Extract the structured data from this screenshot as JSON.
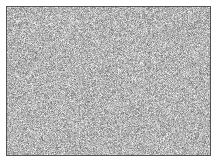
{
  "figure": {
    "kind": "noise-texture-image",
    "caption": "",
    "canvas": {
      "width": 220,
      "height": 165,
      "background_color": "#ffffff"
    },
    "panel": {
      "left": 6,
      "top": 6,
      "width": 205,
      "height": 150,
      "border_width": 1,
      "border_color": "#555555",
      "fill_base_color": "#b4b4b4"
    },
    "texture": {
      "type": "white-noise",
      "grayscale": true,
      "grain_size_px": 1,
      "mean_level": 180,
      "spread": 62,
      "min_level": 40,
      "max_level": 255,
      "seed": 20240617,
      "color_tint": "none"
    },
    "labels": {
      "title": "",
      "xlabel": "",
      "ylabel": "",
      "legend": []
    }
  }
}
